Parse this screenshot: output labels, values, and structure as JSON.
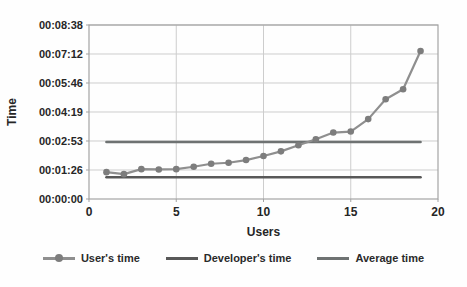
{
  "figure": {
    "background": "#fefefe",
    "text_color": "#262626",
    "gridline_color": "#cdcdcd",
    "border_color": "#a3a3a3"
  },
  "chart_data": {
    "type": "line",
    "title": "",
    "xlabel": "Users",
    "ylabel": "Time",
    "xlim": [
      0,
      20
    ],
    "x_ticks": [
      0,
      5,
      10,
      15,
      20
    ],
    "x_gridlines": [
      5,
      10,
      15
    ],
    "ylim_seconds": [
      0,
      518.4
    ],
    "y_ticks": [
      {
        "seconds": 0,
        "label": "00:00:00"
      },
      {
        "seconds": 86.4,
        "label": "00:01:26"
      },
      {
        "seconds": 172.8,
        "label": "00:02:53"
      },
      {
        "seconds": 259.2,
        "label": "00:04:19"
      },
      {
        "seconds": 345.6,
        "label": "00:05:46"
      },
      {
        "seconds": 432,
        "label": "00:07:12"
      },
      {
        "seconds": 518.4,
        "label": "00:08:38"
      }
    ],
    "grid": true,
    "legend_position": "bottom",
    "x": [
      1,
      2,
      3,
      4,
      5,
      6,
      7,
      8,
      9,
      10,
      11,
      12,
      13,
      14,
      15,
      16,
      17,
      18,
      19
    ],
    "series": [
      {
        "name": "User's time",
        "color": "#8f8f8f",
        "marker": "circle",
        "marker_color": "#7d7d7d",
        "values_seconds": [
          80,
          74,
          89,
          88,
          89,
          96,
          105,
          108,
          116,
          128,
          142,
          160,
          178,
          198,
          201,
          238,
          297,
          327,
          441
        ],
        "values_hms": [
          "00:01:20",
          "00:01:14",
          "00:01:29",
          "00:01:28",
          "00:01:29",
          "00:01:36",
          "00:01:45",
          "00:01:48",
          "00:01:56",
          "00:02:08",
          "00:02:22",
          "00:02:40",
          "00:02:58",
          "00:03:18",
          "00:03:21",
          "00:03:58",
          "00:04:57",
          "00:05:27",
          "00:07:21"
        ]
      },
      {
        "name": "Developer's time",
        "color": "#585858",
        "marker": "none",
        "constant_seconds": 65,
        "constant_hms": "00:01:05",
        "x_range": [
          1,
          19
        ]
      },
      {
        "name": "Average time",
        "color": "#6e7272",
        "marker": "none",
        "constant_seconds": 170,
        "constant_hms": "00:02:50",
        "x_range": [
          1,
          19
        ]
      }
    ]
  },
  "legend": {
    "items": [
      {
        "label": "User's time"
      },
      {
        "label": "Developer's time"
      },
      {
        "label": "Average time"
      }
    ]
  }
}
